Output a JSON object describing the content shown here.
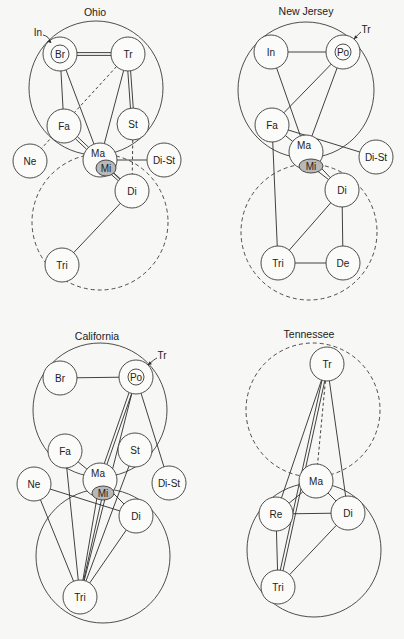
{
  "panels": [
    {
      "title": "Ohio",
      "title_pos": [
        95,
        16
      ],
      "big_circles": [
        {
          "cx": 96,
          "cy": 88,
          "r": 67,
          "style": "solid"
        },
        {
          "cx": 100,
          "cy": 222,
          "r": 68,
          "style": "dashed"
        }
      ],
      "nodes": [
        {
          "id": "Br",
          "label": "Br",
          "cx": 60,
          "cy": 54,
          "r": 9,
          "ring": 17
        },
        {
          "id": "Tr",
          "label": "Tr",
          "cx": 128,
          "cy": 54,
          "r": 17
        },
        {
          "id": "Fa",
          "label": "Fa",
          "cx": 64,
          "cy": 126,
          "r": 17
        },
        {
          "id": "St",
          "label": "St",
          "cx": 133,
          "cy": 124,
          "r": 16
        },
        {
          "id": "Ne",
          "label": "Ne",
          "cx": 30,
          "cy": 161,
          "r": 17
        },
        {
          "id": "Ma",
          "label": "Ma",
          "cx": 100,
          "cy": 160,
          "r": 17,
          "mi": {
            "label": "Mi",
            "cx": 106,
            "cy": 168,
            "rx": 10,
            "ry": 8
          }
        },
        {
          "id": "DiSt",
          "label": "Di-St",
          "cx": 164,
          "cy": 160,
          "r": 17
        },
        {
          "id": "Di",
          "label": "Di",
          "cx": 132,
          "cy": 191,
          "r": 17
        },
        {
          "id": "Tri",
          "label": "Tri",
          "cx": 62,
          "cy": 265,
          "r": 17
        }
      ],
      "annotations": [
        {
          "label": "In",
          "x": 38,
          "y": 32,
          "arrow_to": [
            51,
            43
          ]
        }
      ],
      "edges": [
        {
          "from": "Br",
          "to": "Tr",
          "type": "double"
        },
        {
          "from": "Br",
          "to": "Fa",
          "type": "single"
        },
        {
          "from": "Br",
          "to": "Ma",
          "type": "single"
        },
        {
          "from": "Tr",
          "to": "St",
          "type": "double"
        },
        {
          "from": "Tr",
          "to": "Ma",
          "type": "single"
        },
        {
          "from": "Tr",
          "to": "Ne",
          "type": "dashed"
        },
        {
          "from": "St",
          "to": "Di",
          "type": "dashed"
        },
        {
          "from": "Fa",
          "to": "Ma",
          "type": "double"
        },
        {
          "from": "Ma",
          "to": "DiSt",
          "type": "single"
        },
        {
          "from": "Mi",
          "to": "Di",
          "type": "double"
        },
        {
          "from": "Ma",
          "to": "Di",
          "type": "single"
        },
        {
          "from": "Di",
          "to": "Tri",
          "type": "single"
        }
      ]
    },
    {
      "title": "New Jersey",
      "title_pos": [
        306,
        15
      ],
      "big_circles": [
        {
          "cx": 306,
          "cy": 90,
          "r": 68,
          "style": "solid"
        },
        {
          "cx": 309,
          "cy": 232,
          "r": 68,
          "style": "dashed"
        }
      ],
      "nodes": [
        {
          "id": "In",
          "label": "In",
          "cx": 271,
          "cy": 52,
          "r": 17
        },
        {
          "id": "Po",
          "label": "Po",
          "cx": 343,
          "cy": 52,
          "r": 8,
          "ring": 17
        },
        {
          "id": "Fa",
          "label": "Fa",
          "cx": 272,
          "cy": 125,
          "r": 17
        },
        {
          "id": "Ma",
          "label": "Ma",
          "cx": 306,
          "cy": 152,
          "r": 17,
          "mi": {
            "label": "Mi",
            "cx": 311,
            "cy": 166,
            "rx": 12,
            "ry": 7
          }
        },
        {
          "id": "DiSt",
          "label": "Di-St",
          "cx": 376,
          "cy": 157,
          "r": 17
        },
        {
          "id": "Di",
          "label": "Di",
          "cx": 342,
          "cy": 190,
          "r": 17
        },
        {
          "id": "Tri",
          "label": "Tri",
          "cx": 278,
          "cy": 263,
          "r": 17
        },
        {
          "id": "De",
          "label": "De",
          "cx": 343,
          "cy": 263,
          "r": 17
        }
      ],
      "annotations": [
        {
          "label": "Tr",
          "x": 366,
          "y": 29,
          "arrow_to": [
            354,
            39
          ]
        }
      ],
      "edges": [
        {
          "from": "In",
          "to": "Po",
          "type": "single"
        },
        {
          "from": "In",
          "to": "Ma",
          "type": "single"
        },
        {
          "from": "Po",
          "to": "Fa",
          "type": "single"
        },
        {
          "from": "Po",
          "to": "Ma",
          "type": "single"
        },
        {
          "from": "Fa",
          "to": "Ma",
          "type": "single"
        },
        {
          "from": "Fa",
          "to": "DiSt",
          "type": "single"
        },
        {
          "from": "Fa",
          "to": "Tri",
          "type": "single"
        },
        {
          "from": "Ma",
          "to": "Di",
          "type": "single"
        },
        {
          "from": "Mi",
          "to": "Di",
          "type": "single"
        },
        {
          "from": "Di",
          "to": "Tri",
          "type": "single"
        },
        {
          "from": "Di",
          "to": "De",
          "type": "single"
        },
        {
          "from": "Tri",
          "to": "De",
          "type": "single"
        }
      ]
    },
    {
      "title": "California",
      "title_pos": [
        97,
        340
      ],
      "big_circles": [
        {
          "cx": 100,
          "cy": 410,
          "r": 67,
          "style": "solid"
        },
        {
          "cx": 103,
          "cy": 556,
          "r": 67,
          "style": "solid"
        }
      ],
      "nodes": [
        {
          "id": "Br",
          "label": "Br",
          "cx": 60,
          "cy": 378,
          "r": 17
        },
        {
          "id": "Po",
          "label": "Po",
          "cx": 136,
          "cy": 377,
          "r": 8,
          "ring": 17
        },
        {
          "id": "Fa",
          "label": "Fa",
          "cx": 65,
          "cy": 451,
          "r": 17
        },
        {
          "id": "St",
          "label": "St",
          "cx": 135,
          "cy": 450,
          "r": 17
        },
        {
          "id": "Ne",
          "label": "Ne",
          "cx": 34,
          "cy": 484,
          "r": 17
        },
        {
          "id": "Ma",
          "label": "Ma",
          "cx": 100,
          "cy": 480,
          "r": 17,
          "mi": {
            "label": "Mi",
            "cx": 103,
            "cy": 493,
            "rx": 11,
            "ry": 7
          }
        },
        {
          "id": "DiSt",
          "label": "Di-St",
          "cx": 169,
          "cy": 483,
          "r": 17
        },
        {
          "id": "Di",
          "label": "Di",
          "cx": 136,
          "cy": 516,
          "r": 17
        },
        {
          "id": "Tri",
          "label": "Tri",
          "cx": 80,
          "cy": 597,
          "r": 17
        }
      ],
      "annotations": [
        {
          "label": "Tr",
          "x": 162,
          "y": 355,
          "arrow_to": [
            148,
            365
          ]
        }
      ],
      "edges": [
        {
          "from": "Br",
          "to": "Po",
          "type": "single"
        },
        {
          "from": "Po",
          "to": "Ma",
          "type": "double"
        },
        {
          "from": "Po",
          "to": "DiSt",
          "type": "single"
        },
        {
          "from": "Fa",
          "to": "Ma",
          "type": "single"
        },
        {
          "from": "Fa",
          "to": "Tri",
          "type": "single"
        },
        {
          "from": "St",
          "to": "Tri",
          "type": "single"
        },
        {
          "from": "Ne",
          "to": "Tri",
          "type": "single"
        },
        {
          "from": "Ne",
          "to": "Di",
          "type": "single"
        },
        {
          "from": "Ma",
          "to": "Tri",
          "type": "single"
        },
        {
          "from": "Mi",
          "to": "Tri",
          "type": "single"
        },
        {
          "from": "Ma",
          "to": "Di",
          "type": "single"
        },
        {
          "from": "Di",
          "to": "Tri",
          "type": "single"
        },
        {
          "from": "Po",
          "to": "Tri",
          "type": "single"
        }
      ]
    },
    {
      "title": "Tennessee",
      "title_pos": [
        309,
        338
      ],
      "big_circles": [
        {
          "cx": 313,
          "cy": 410,
          "r": 67,
          "style": "dashed"
        },
        {
          "cx": 314,
          "cy": 550,
          "r": 67,
          "style": "solid"
        }
      ],
      "nodes": [
        {
          "id": "Tr",
          "label": "Tr",
          "cx": 327,
          "cy": 364,
          "r": 17
        },
        {
          "id": "Ma",
          "label": "Ma",
          "cx": 316,
          "cy": 481,
          "r": 17
        },
        {
          "id": "Re",
          "label": "Re",
          "cx": 276,
          "cy": 514,
          "r": 17
        },
        {
          "id": "Di",
          "label": "Di",
          "cx": 348,
          "cy": 513,
          "r": 17
        },
        {
          "id": "Tri",
          "label": "Tri",
          "cx": 278,
          "cy": 587,
          "r": 17
        }
      ],
      "annotations": [],
      "edges": [
        {
          "from": "Tr",
          "to": "Re",
          "type": "single"
        },
        {
          "from": "Tr",
          "to": "Tri",
          "type": "double"
        },
        {
          "from": "Tr",
          "to": "Di",
          "type": "single"
        },
        {
          "from": "Tr",
          "to": "Ma",
          "type": "dashed"
        },
        {
          "from": "Ma",
          "to": "Re",
          "type": "single"
        },
        {
          "from": "Ma",
          "to": "Di",
          "type": "single"
        },
        {
          "from": "Re",
          "to": "Di",
          "type": "single"
        },
        {
          "from": "Re",
          "to": "Tri",
          "type": "single"
        },
        {
          "from": "Di",
          "to": "Tri",
          "type": "single"
        }
      ]
    }
  ]
}
